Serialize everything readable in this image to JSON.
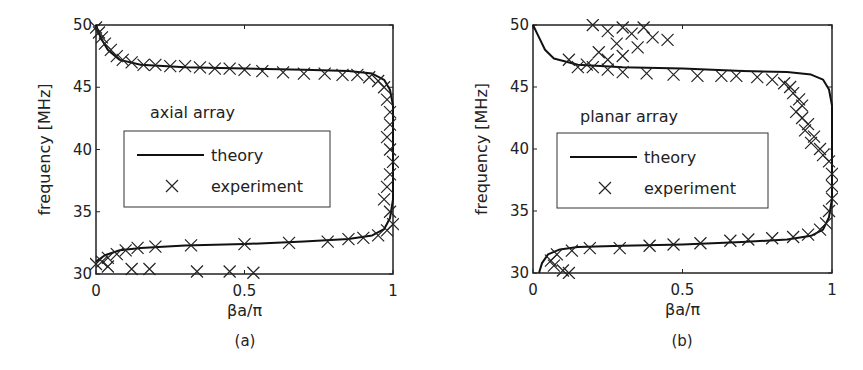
{
  "figure": {
    "panels": [
      {
        "id": "a",
        "caption": "(a)",
        "annotation": "axial array",
        "xlabel": "βa/π",
        "ylabel": "frequency [MHz]",
        "xticks": [
          "0",
          "0.5",
          "1"
        ],
        "yticks": [
          "30",
          "35",
          "40",
          "45",
          "50"
        ],
        "legend": {
          "theory": "theory",
          "experiment": "experiment"
        }
      },
      {
        "id": "b",
        "caption": "(b)",
        "annotation": "planar array",
        "xlabel": "βa/π",
        "ylabel": "frequency [MHz]",
        "xticks": [
          "0",
          "0.5",
          "1"
        ],
        "yticks": [
          "30",
          "35",
          "40",
          "45",
          "50"
        ],
        "legend": {
          "theory": "theory",
          "experiment": "experiment"
        }
      }
    ]
  },
  "chart_data": [
    {
      "type": "line",
      "title": "axial array",
      "caption": "(a)",
      "xlabel": "βa/π",
      "ylabel": "frequency [MHz]",
      "xlim": [
        0,
        1
      ],
      "ylim": [
        30,
        50
      ],
      "xticks": [
        0,
        0.5,
        1
      ],
      "yticks": [
        30,
        35,
        40,
        45,
        50
      ],
      "grid": false,
      "legend_position": "center-left inside",
      "annotations": [
        "axial array"
      ],
      "series": [
        {
          "name": "theory",
          "style": "solid line",
          "points": [
            [
              0.0,
              31.0
            ],
            [
              0.03,
              31.5
            ],
            [
              0.08,
              31.9
            ],
            [
              0.15,
              32.1
            ],
            [
              0.3,
              32.3
            ],
            [
              0.5,
              32.4
            ],
            [
              0.7,
              32.6
            ],
            [
              0.85,
              32.8
            ],
            [
              0.93,
              33.1
            ],
            [
              0.97,
              33.6
            ],
            [
              0.99,
              34.5
            ],
            [
              1.0,
              36
            ],
            [
              1.0,
              40
            ],
            [
              1.0,
              43.5
            ],
            [
              0.99,
              44.8
            ],
            [
              0.97,
              45.6
            ],
            [
              0.93,
              46.1
            ],
            [
              0.85,
              46.3
            ],
            [
              0.7,
              46.4
            ],
            [
              0.5,
              46.5
            ],
            [
              0.3,
              46.6
            ],
            [
              0.15,
              46.8
            ],
            [
              0.08,
              47.2
            ],
            [
              0.04,
              48
            ],
            [
              0.015,
              49
            ],
            [
              0.0,
              50
            ]
          ]
        },
        {
          "name": "experiment",
          "style": "x markers",
          "points": [
            [
              0.0,
              49.8
            ],
            [
              0.01,
              49.4
            ],
            [
              0.02,
              49.0
            ],
            [
              0.03,
              48.5
            ],
            [
              0.05,
              48.0
            ],
            [
              0.07,
              47.5
            ],
            [
              0.09,
              47.2
            ],
            [
              0.12,
              47.0
            ],
            [
              0.16,
              46.8
            ],
            [
              0.2,
              46.8
            ],
            [
              0.25,
              46.7
            ],
            [
              0.3,
              46.7
            ],
            [
              0.35,
              46.6
            ],
            [
              0.4,
              46.5
            ],
            [
              0.45,
              46.5
            ],
            [
              0.5,
              46.4
            ],
            [
              0.56,
              46.3
            ],
            [
              0.63,
              46.2
            ],
            [
              0.7,
              46.1
            ],
            [
              0.77,
              46.1
            ],
            [
              0.83,
              46.0
            ],
            [
              0.88,
              46.0
            ],
            [
              0.92,
              45.8
            ],
            [
              0.95,
              45.5
            ],
            [
              0.97,
              45.0
            ],
            [
              0.98,
              44.0
            ],
            [
              0.99,
              43.0
            ],
            [
              0.99,
              42.0
            ],
            [
              0.98,
              41.0
            ],
            [
              0.99,
              40.0
            ],
            [
              1.0,
              39.0
            ],
            [
              0.99,
              38.0
            ],
            [
              0.98,
              37.0
            ],
            [
              0.97,
              36.0
            ],
            [
              0.99,
              35.0
            ],
            [
              1.0,
              34.0
            ],
            [
              0.98,
              33.5
            ],
            [
              0.95,
              33.1
            ],
            [
              0.9,
              32.9
            ],
            [
              0.85,
              32.8
            ],
            [
              0.78,
              32.6
            ],
            [
              0.65,
              32.5
            ],
            [
              0.5,
              32.4
            ],
            [
              0.32,
              32.3
            ],
            [
              0.2,
              32.2
            ],
            [
              0.14,
              32.1
            ],
            [
              0.1,
              31.9
            ],
            [
              0.07,
              31.6
            ],
            [
              0.04,
              31.3
            ],
            [
              0.02,
              31.0
            ],
            [
              0.0,
              30.8
            ],
            [
              0.04,
              30.6
            ],
            [
              0.12,
              30.4
            ],
            [
              0.18,
              30.4
            ],
            [
              0.34,
              30.2
            ],
            [
              0.45,
              30.2
            ],
            [
              0.53,
              30.1
            ]
          ]
        }
      ]
    },
    {
      "type": "line",
      "title": "planar array",
      "caption": "(b)",
      "xlabel": "βa/π",
      "ylabel": "frequency [MHz]",
      "xlim": [
        0,
        1
      ],
      "ylim": [
        30,
        50
      ],
      "xticks": [
        0,
        0.5,
        1
      ],
      "yticks": [
        30,
        35,
        40,
        45,
        50
      ],
      "grid": false,
      "legend_position": "center-left inside",
      "annotations": [
        "planar array"
      ],
      "series": [
        {
          "name": "theory",
          "style": "solid line",
          "points": [
            [
              0.02,
              30.0
            ],
            [
              0.03,
              30.8
            ],
            [
              0.05,
              31.5
            ],
            [
              0.09,
              31.9
            ],
            [
              0.15,
              32.1
            ],
            [
              0.3,
              32.2
            ],
            [
              0.5,
              32.3
            ],
            [
              0.7,
              32.5
            ],
            [
              0.85,
              32.7
            ],
            [
              0.93,
              33.0
            ],
            [
              0.97,
              33.5
            ],
            [
              0.99,
              34.5
            ],
            [
              1.0,
              36
            ],
            [
              1.0,
              40
            ],
            [
              1.0,
              43.5
            ],
            [
              0.99,
              44.8
            ],
            [
              0.97,
              45.6
            ],
            [
              0.93,
              46.0
            ],
            [
              0.85,
              46.2
            ],
            [
              0.7,
              46.3
            ],
            [
              0.5,
              46.5
            ],
            [
              0.3,
              46.6
            ],
            [
              0.15,
              46.8
            ],
            [
              0.07,
              47.3
            ],
            [
              0.04,
              48
            ],
            [
              0.02,
              49
            ],
            [
              0.0,
              50
            ]
          ]
        },
        {
          "name": "experiment",
          "style": "x markers",
          "points": [
            [
              0.2,
              50.0
            ],
            [
              0.3,
              49.8
            ],
            [
              0.37,
              49.8
            ],
            [
              0.25,
              49.5
            ],
            [
              0.33,
              49.3
            ],
            [
              0.4,
              49.0
            ],
            [
              0.45,
              48.8
            ],
            [
              0.28,
              48.5
            ],
            [
              0.35,
              48.2
            ],
            [
              0.22,
              47.8
            ],
            [
              0.3,
              47.5
            ],
            [
              0.25,
              47.2
            ],
            [
              0.12,
              47.2
            ],
            [
              0.18,
              46.8
            ],
            [
              0.2,
              46.6
            ],
            [
              0.15,
              46.6
            ],
            [
              0.25,
              46.4
            ],
            [
              0.3,
              46.2
            ],
            [
              0.38,
              46.1
            ],
            [
              0.47,
              46.0
            ],
            [
              0.55,
              45.9
            ],
            [
              0.63,
              45.9
            ],
            [
              0.68,
              45.9
            ],
            [
              0.75,
              45.8
            ],
            [
              0.8,
              45.6
            ],
            [
              0.84,
              45.3
            ],
            [
              0.86,
              45.0
            ],
            [
              0.87,
              44.5
            ],
            [
              0.89,
              44.0
            ],
            [
              0.9,
              43.5
            ],
            [
              0.88,
              43.0
            ],
            [
              0.9,
              42.5
            ],
            [
              0.92,
              42.0
            ],
            [
              0.91,
              41.5
            ],
            [
              0.94,
              41.0
            ],
            [
              0.93,
              40.5
            ],
            [
              0.96,
              40.0
            ],
            [
              0.97,
              39.5
            ],
            [
              0.99,
              39.0
            ],
            [
              1.0,
              38.0
            ],
            [
              1.0,
              37.0
            ],
            [
              1.0,
              36.0
            ],
            [
              0.99,
              35.0
            ],
            [
              0.98,
              34.0
            ],
            [
              0.96,
              33.5
            ],
            [
              0.92,
              33.1
            ],
            [
              0.87,
              32.9
            ],
            [
              0.8,
              32.8
            ],
            [
              0.72,
              32.7
            ],
            [
              0.66,
              32.6
            ],
            [
              0.56,
              32.4
            ],
            [
              0.47,
              32.3
            ],
            [
              0.39,
              32.2
            ],
            [
              0.29,
              32.0
            ],
            [
              0.19,
              32.0
            ],
            [
              0.13,
              31.8
            ],
            [
              0.08,
              31.5
            ],
            [
              0.06,
              31.0
            ],
            [
              0.07,
              30.6
            ],
            [
              0.1,
              30.2
            ],
            [
              0.12,
              30.0
            ]
          ]
        }
      ]
    }
  ]
}
